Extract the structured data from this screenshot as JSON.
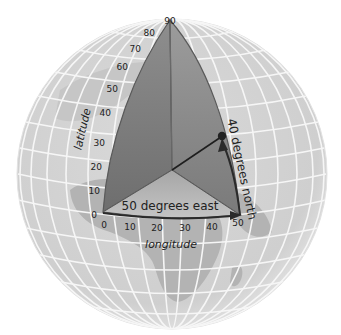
{
  "colors": {
    "background": "#ffffff",
    "globe_fill": "#d4d4d4",
    "globe_edge": "#bdbdbd",
    "land_fill": "#aaaaaa",
    "grid_line": "#f4f4f4",
    "wedge_dark": "#7c7c7c",
    "wedge_mid": "#9a9a9a",
    "wedge_light": "#b8b8b8",
    "wedge_edge": "#555555",
    "arrow": "#222222",
    "point": "#222222"
  },
  "diagram": {
    "latitude_axis": {
      "label": "latitude",
      "ticks": [
        "0",
        "10",
        "20",
        "30",
        "40",
        "50",
        "60",
        "70",
        "80",
        "90"
      ]
    },
    "longitude_axis": {
      "label": "longitude",
      "ticks": [
        "0",
        "10",
        "20",
        "30",
        "40",
        "50"
      ]
    },
    "annotations": {
      "east_label": "50 degrees east",
      "north_label": "40 degrees north"
    },
    "point": {
      "latitude": 40,
      "longitude": 50
    }
  }
}
